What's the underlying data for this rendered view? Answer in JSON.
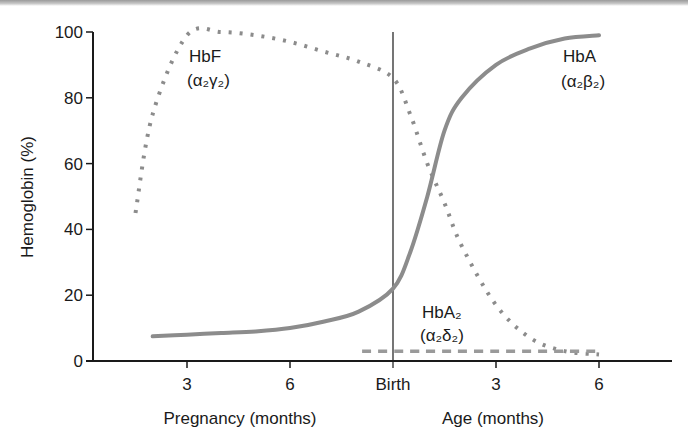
{
  "chart_data": {
    "type": "line",
    "title": "",
    "ylabel": "Hemoglobin (%)",
    "ylim": [
      0,
      100
    ],
    "yticks": [
      "0",
      "20",
      "40",
      "60",
      "80",
      "100"
    ],
    "xtick_labels": [
      "3",
      "6",
      "Birth",
      "3",
      "6"
    ],
    "xlabels": {
      "left": "Pregnancy (months)",
      "right": "Age (months)"
    },
    "x_description": "Time from ~1.5 months gestation through 6 months after birth; Birth at gestational month 9",
    "x": [
      1.5,
      2,
      3,
      4,
      5,
      6,
      7,
      8,
      9,
      9.5,
      10,
      10.5,
      11,
      12,
      13,
      14,
      15
    ],
    "series": [
      {
        "name": "HbF",
        "subunits": "α2γ2",
        "style": "dotted",
        "values": [
          45,
          75,
          99,
          100,
          99,
          97,
          94,
          91,
          86,
          75,
          60,
          48,
          35,
          17,
          7,
          3,
          2
        ]
      },
      {
        "name": "HbA",
        "subunits": "α2β2",
        "style": "solid",
        "values": [
          null,
          7.5,
          8,
          8.5,
          9,
          10,
          12,
          15,
          22,
          33,
          50,
          70,
          80,
          90,
          95,
          98,
          99
        ]
      },
      {
        "name": "HbA2",
        "subunits": "α2δ2",
        "style": "dashed",
        "values": [
          null,
          null,
          null,
          null,
          null,
          null,
          null,
          null,
          3,
          3,
          3,
          3,
          3,
          3,
          3,
          3,
          3
        ]
      }
    ],
    "annotations": [
      "Vertical line at Birth"
    ],
    "grid": false,
    "legend": "inline labels"
  },
  "labels": {
    "hbf_name": "HbF",
    "hbf_sub": "(α₂γ₂)",
    "hba_name": "HbA",
    "hba_sub": "(α₂β₂)",
    "hba2_name": "HbA₂",
    "hba2_sub": "(α₂δ₂)"
  },
  "colors": {
    "curve": "#8c8c8c",
    "axis": "#1a1a1a"
  }
}
